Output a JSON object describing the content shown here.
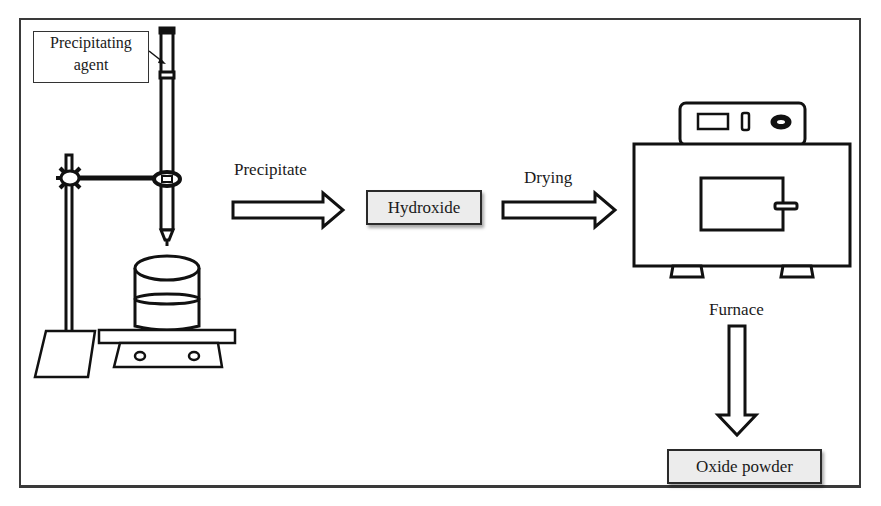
{
  "diagram": {
    "apparatus": {
      "agent_label_line1": "Precipitating",
      "agent_label_line2": "agent",
      "components": [
        "burette",
        "retort-stand",
        "clamp",
        "beaker",
        "magnetic-stirrer"
      ]
    },
    "steps": [
      {
        "arrow_label": "Precipitate",
        "box_label": "Hydroxide"
      },
      {
        "arrow_label": "Drying",
        "target": "drying-oven"
      },
      {
        "arrow_label": "Furnace",
        "box_label": "Oxide powder"
      }
    ],
    "colors": {
      "stroke": "#111111",
      "box_fill": "#ececec",
      "frame": "#3a3a3a",
      "background": "#ffffff"
    }
  }
}
